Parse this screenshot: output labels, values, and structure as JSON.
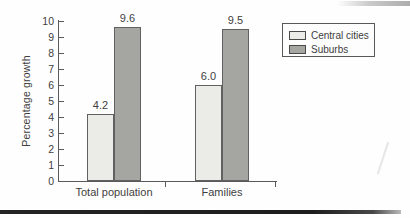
{
  "chart_data": {
    "type": "bar",
    "title": "",
    "xlabel": "",
    "ylabel": "Percentage growth",
    "categories": [
      "Total population",
      "Families"
    ],
    "series": [
      {
        "name": "Central cities",
        "values": [
          4.2,
          6.0
        ],
        "labels": [
          "4.2",
          "6.0"
        ],
        "color": "#ebebe7"
      },
      {
        "name": "Suburbs",
        "values": [
          9.6,
          9.5
        ],
        "labels": [
          "9.6",
          "9.5"
        ],
        "color": "#a5a5a2"
      }
    ],
    "ylim": [
      0,
      10
    ],
    "yticks": [
      0,
      1,
      2,
      3,
      4,
      5,
      6,
      7,
      8,
      9,
      10
    ],
    "grid": false,
    "legend": {
      "position": "top-right",
      "entries": [
        "Central cities",
        "Suburbs"
      ]
    }
  },
  "colors": {
    "axis": "#5a5a5a",
    "text": "#3e3e3e",
    "bar_border": "#616161",
    "central_cities_fill": "#ebebe7",
    "suburbs_fill": "#a5a5a2",
    "bottom_rule": "#1d1d1d"
  }
}
